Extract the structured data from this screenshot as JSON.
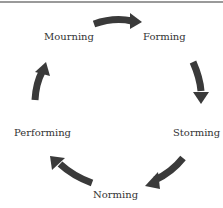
{
  "diagram": {
    "type": "cycle",
    "stages": [
      {
        "label": "Forming"
      },
      {
        "label": "Storming"
      },
      {
        "label": "Norming"
      },
      {
        "label": "Performing"
      },
      {
        "label": "Mourning"
      }
    ],
    "arrow_color": "#3a3a3a",
    "text_color": "#333333"
  }
}
